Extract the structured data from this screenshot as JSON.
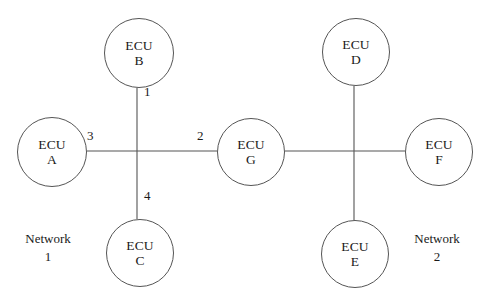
{
  "diagram": {
    "type": "network-topology",
    "canvas": {
      "width": 482,
      "height": 295
    },
    "stroke_color": "#555555",
    "text_color": "#1a1a1a",
    "background_color": "#ffffff"
  },
  "nodes": [
    {
      "key": "A",
      "kind": "ECU",
      "id": "A",
      "cx": 52,
      "cy": 152,
      "r": 35,
      "network": "1"
    },
    {
      "key": "B",
      "kind": "ECU",
      "id": "B",
      "cx": 139,
      "cy": 53,
      "r": 35,
      "network": "1"
    },
    {
      "key": "C",
      "kind": "ECU",
      "id": "C",
      "cx": 140,
      "cy": 253,
      "r": 34,
      "network": "1"
    },
    {
      "key": "G",
      "kind": "ECU",
      "id": "G",
      "cx": 251,
      "cy": 152,
      "r": 34,
      "network": "gateway"
    },
    {
      "key": "D",
      "kind": "ECU",
      "id": "D",
      "cx": 356,
      "cy": 52,
      "r": 34,
      "network": "2"
    },
    {
      "key": "E",
      "kind": "ECU",
      "id": "E",
      "cx": 355,
      "cy": 254,
      "r": 34,
      "network": "2"
    },
    {
      "key": "F",
      "kind": "ECU",
      "id": "F",
      "cx": 439,
      "cy": 152,
      "r": 34,
      "network": "2"
    }
  ],
  "junctions": [
    {
      "key": "J1",
      "x": 137,
      "y": 151,
      "network": "1"
    },
    {
      "key": "J2",
      "x": 354,
      "y": 151,
      "network": "2"
    }
  ],
  "edges": [
    {
      "key": "B-J1",
      "from": "B",
      "to": "J1",
      "label": "1",
      "network": "1"
    },
    {
      "key": "J1-G",
      "from": "J1",
      "to": "G",
      "label": "2",
      "network": "1"
    },
    {
      "key": "A-J1",
      "from": "A",
      "to": "J1",
      "label": "3",
      "network": "1"
    },
    {
      "key": "J1-C",
      "from": "J1",
      "to": "C",
      "label": "4",
      "network": "1"
    },
    {
      "key": "G-J2",
      "from": "G",
      "to": "J2",
      "label": "",
      "network": "2"
    },
    {
      "key": "D-J2",
      "from": "D",
      "to": "J2",
      "label": "",
      "network": "2"
    },
    {
      "key": "J2-F",
      "from": "J2",
      "to": "F",
      "label": "",
      "network": "2"
    },
    {
      "key": "J2-E",
      "from": "J2",
      "to": "E",
      "label": "",
      "network": "2"
    }
  ],
  "edge_labels": [
    {
      "key": "label-1",
      "text": "1",
      "x": 144,
      "y": 84
    },
    {
      "key": "label-2",
      "text": "2",
      "x": 197,
      "y": 128
    },
    {
      "key": "label-3",
      "text": "3",
      "x": 87,
      "y": 128
    },
    {
      "key": "label-4",
      "text": "4",
      "x": 144,
      "y": 188
    }
  ],
  "network_labels": [
    {
      "key": "network-1",
      "name": "Network",
      "number": "1",
      "cx": 48,
      "y": 230
    },
    {
      "key": "network-2",
      "name": "Network",
      "number": "2",
      "cx": 437,
      "y": 230
    }
  ]
}
